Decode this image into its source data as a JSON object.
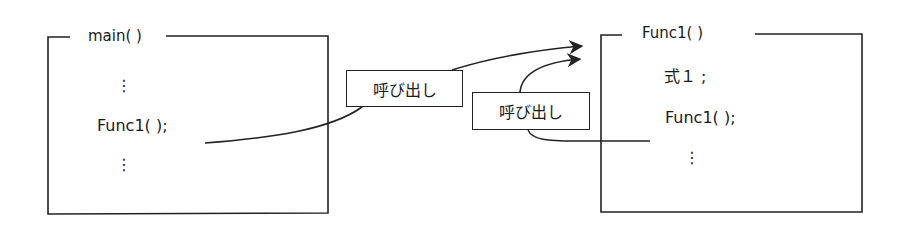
{
  "diagram": {
    "caller": {
      "title": "main( )",
      "lines": [
        "⋮",
        "Func1( );",
        "⋮"
      ]
    },
    "callee": {
      "title": "Func1( )",
      "lines": [
        "式１ ;",
        "Func1( );",
        "⋮"
      ]
    },
    "callouts": [
      {
        "label": "呼び出し"
      },
      {
        "label": "呼び出し"
      }
    ],
    "colors": {
      "line": "#222222",
      "background": "#ffffff"
    }
  }
}
